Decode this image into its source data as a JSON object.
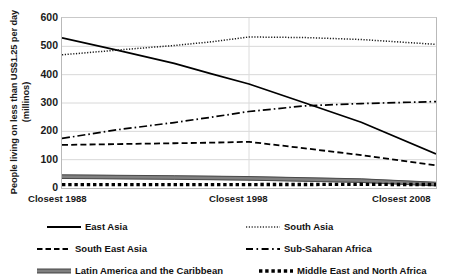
{
  "chart_data": {
    "type": "line",
    "title": "",
    "xlabel": "",
    "ylabel": "People living on less than US$1.25 per day (millinos)",
    "ylabel_line1": "People living on less than US$1.25 per day",
    "ylabel_line2": "(millinos)",
    "categories": [
      "Closest 1988",
      "Closest 1998",
      "Closest 2008"
    ],
    "x": [
      1988,
      1998,
      2008
    ],
    "ylim": [
      0,
      600
    ],
    "yticks": [
      "0",
      "100",
      "200",
      "300",
      "400",
      "500",
      "600"
    ],
    "ytick_values": [
      0,
      100,
      200,
      300,
      400,
      500,
      600
    ],
    "grid": "horizontal",
    "legend_position": "bottom",
    "series": [
      {
        "name": "East Asia",
        "style": "solid",
        "color": "#000000",
        "values": [
          530,
          367,
          120
        ],
        "points": [
          {
            "x": 1988,
            "y": 530
          },
          {
            "x": 1991,
            "y": 486
          },
          {
            "x": 1994,
            "y": 440
          },
          {
            "x": 1996,
            "y": 403
          },
          {
            "x": 1998,
            "y": 367
          },
          {
            "x": 2001,
            "y": 300
          },
          {
            "x": 2004,
            "y": 232
          },
          {
            "x": 2008,
            "y": 120
          }
        ]
      },
      {
        "name": "South Asia",
        "style": "dotted-fine",
        "color": "#1a1a1a",
        "values": [
          470,
          533,
          507
        ],
        "points": [
          {
            "x": 1988,
            "y": 470
          },
          {
            "x": 1991,
            "y": 487
          },
          {
            "x": 1994,
            "y": 503
          },
          {
            "x": 1996,
            "y": 516
          },
          {
            "x": 1998,
            "y": 533
          },
          {
            "x": 2001,
            "y": 531
          },
          {
            "x": 2004,
            "y": 524
          },
          {
            "x": 2008,
            "y": 507
          }
        ]
      },
      {
        "name": "South East Asia",
        "style": "dashed",
        "color": "#000000",
        "values": [
          152,
          163,
          80
        ],
        "points": [
          {
            "x": 1988,
            "y": 152
          },
          {
            "x": 1991,
            "y": 155
          },
          {
            "x": 1994,
            "y": 158
          },
          {
            "x": 1996,
            "y": 160
          },
          {
            "x": 1998,
            "y": 163
          },
          {
            "x": 2001,
            "y": 140
          },
          {
            "x": 2004,
            "y": 116
          },
          {
            "x": 2008,
            "y": 80
          }
        ]
      },
      {
        "name": "Sub-Saharan Africa",
        "style": "dash-dot",
        "color": "#000000",
        "values": [
          175,
          270,
          305
        ],
        "points": [
          {
            "x": 1988,
            "y": 175
          },
          {
            "x": 1991,
            "y": 206
          },
          {
            "x": 1994,
            "y": 231
          },
          {
            "x": 1996,
            "y": 250
          },
          {
            "x": 1998,
            "y": 270
          },
          {
            "x": 2001,
            "y": 290
          },
          {
            "x": 2004,
            "y": 298
          },
          {
            "x": 2008,
            "y": 305
          }
        ]
      },
      {
        "name": "Latin America and the Caribbean",
        "style": "thick-solid-gray",
        "color": "#808080",
        "values": [
          40,
          34,
          14
        ],
        "points": [
          {
            "x": 1988,
            "y": 40
          },
          {
            "x": 1994,
            "y": 37
          },
          {
            "x": 1998,
            "y": 34
          },
          {
            "x": 2004,
            "y": 26
          },
          {
            "x": 2008,
            "y": 14
          }
        ]
      },
      {
        "name": "Middle East and North Africa",
        "style": "thick-dotted",
        "color": "#000000",
        "values": [
          12,
          12,
          12
        ],
        "points": [
          {
            "x": 1988,
            "y": 12
          },
          {
            "x": 1994,
            "y": 12
          },
          {
            "x": 1998,
            "y": 12
          },
          {
            "x": 2004,
            "y": 13
          },
          {
            "x": 2008,
            "y": 12
          }
        ]
      }
    ]
  },
  "axis": {
    "y_title_line1": "People living on less than US$1.25 per day",
    "y_title_line2": "(millinos)",
    "yticks": [
      "600",
      "500",
      "400",
      "300",
      "200",
      "100",
      "0"
    ],
    "xticks": [
      "Closest 1988",
      "Closest 1998",
      "Closest 2008"
    ]
  },
  "legend": {
    "items": [
      {
        "label": "East Asia",
        "marker": "solid-line-icon"
      },
      {
        "label": "South Asia",
        "marker": "fine-dotted-line-icon"
      },
      {
        "label": "South East Asia",
        "marker": "dashed-line-icon"
      },
      {
        "label": "Sub-Saharan Africa",
        "marker": "dash-dot-line-icon"
      },
      {
        "label": "Latin America and the Caribbean",
        "marker": "thick-gray-line-icon"
      },
      {
        "label": "Middle East and North Africa",
        "marker": "thick-dotted-line-icon"
      }
    ]
  }
}
